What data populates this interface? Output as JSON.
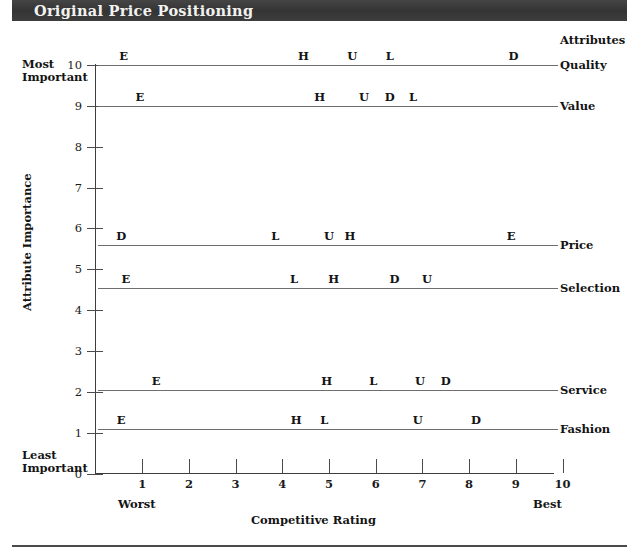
{
  "header": {
    "title": "Original Price Positioning"
  },
  "axes": {
    "y_title": "Attribute Importance",
    "x_title": "Competitive Rating",
    "y_top_caption_line1": "Most",
    "y_top_caption_line2": "Important",
    "y_bottom_caption_line1": "Least",
    "y_bottom_caption_line2": "Important",
    "x_left_caption": "Worst",
    "x_right_caption": "Best",
    "attributes_heading": "Attributes",
    "y_ticks": [
      "0",
      "1",
      "2",
      "3",
      "4",
      "5",
      "6",
      "7",
      "8",
      "9",
      "10"
    ],
    "x_ticks": [
      "1",
      "2",
      "3",
      "4",
      "5",
      "6",
      "7",
      "8",
      "9",
      "10"
    ]
  },
  "chart_data": {
    "type": "scatter",
    "title": "Original Price Positioning",
    "xlabel": "Competitive Rating",
    "ylabel": "Attribute Importance",
    "xlim": [
      0,
      10
    ],
    "ylim": [
      0,
      10
    ],
    "grid": false,
    "legend": "right-axis-labels",
    "x_axis_annotations": {
      "low": "Worst",
      "high": "Best"
    },
    "y_axis_annotations": {
      "high": "Most Important",
      "low": "Least Important"
    },
    "point_label_key": "Competitor initial letter (E, H, U, L, D)",
    "rows": [
      {
        "attribute": "Quality",
        "importance": 10.0,
        "points": [
          {
            "label": "E",
            "rating": 0.6
          },
          {
            "label": "H",
            "rating": 4.45
          },
          {
            "label": "U",
            "rating": 5.5
          },
          {
            "label": "L",
            "rating": 6.3
          },
          {
            "label": "D",
            "rating": 8.95
          }
        ]
      },
      {
        "attribute": "Value",
        "importance": 9.0,
        "points": [
          {
            "label": "E",
            "rating": 0.95
          },
          {
            "label": "H",
            "rating": 4.8
          },
          {
            "label": "U",
            "rating": 5.75
          },
          {
            "label": "D",
            "rating": 6.3
          },
          {
            "label": "L",
            "rating": 6.8
          }
        ]
      },
      {
        "attribute": "Price",
        "importance": 5.6,
        "points": [
          {
            "label": "D",
            "rating": 0.55
          },
          {
            "label": "L",
            "rating": 3.85
          },
          {
            "label": "U",
            "rating": 5.0
          },
          {
            "label": "H",
            "rating": 5.45
          },
          {
            "label": "E",
            "rating": 8.9
          }
        ]
      },
      {
        "attribute": "Selection",
        "importance": 4.55,
        "points": [
          {
            "label": "E",
            "rating": 0.65
          },
          {
            "label": "L",
            "rating": 4.25
          },
          {
            "label": "H",
            "rating": 5.1
          },
          {
            "label": "D",
            "rating": 6.4
          },
          {
            "label": "U",
            "rating": 7.1
          }
        ]
      },
      {
        "attribute": "Service",
        "importance": 2.05,
        "points": [
          {
            "label": "E",
            "rating": 1.3
          },
          {
            "label": "H",
            "rating": 4.95
          },
          {
            "label": "L",
            "rating": 5.95
          },
          {
            "label": "U",
            "rating": 6.95
          },
          {
            "label": "D",
            "rating": 7.5
          }
        ]
      },
      {
        "attribute": "Fashion",
        "importance": 1.1,
        "points": [
          {
            "label": "E",
            "rating": 0.55
          },
          {
            "label": "H",
            "rating": 4.3
          },
          {
            "label": "L",
            "rating": 4.9
          },
          {
            "label": "U",
            "rating": 6.9
          },
          {
            "label": "D",
            "rating": 8.15
          }
        ]
      }
    ]
  }
}
